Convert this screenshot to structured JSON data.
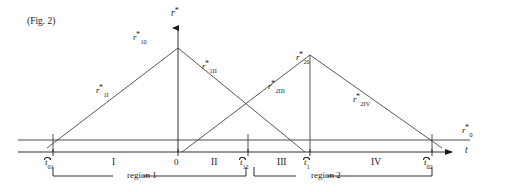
{
  "figure": {
    "caption": "(Fig. 2)",
    "axes": {
      "y_axis_label_base": "r",
      "y_axis_label_star": "*",
      "x_axis_label": "t",
      "baseline_label_base": "r",
      "baseline_label_sub": "0",
      "baseline_label_star": "*"
    },
    "curve_labels": [
      {
        "id": "r10",
        "base": "r",
        "sub": "10",
        "star": "*",
        "x": 133,
        "y": 33
      },
      {
        "id": "r1I",
        "base": "r",
        "sub": "1I",
        "star": "*",
        "x": 96,
        "y": 86
      },
      {
        "id": "r1II",
        "base": "r",
        "sub": "1II",
        "star": "*",
        "x": 202,
        "y": 62
      },
      {
        "id": "r2III",
        "base": "r",
        "sub": "2III",
        "star": "*",
        "x": 268,
        "y": 82
      },
      {
        "id": "r20",
        "base": "r",
        "sub": "20",
        "star": "*",
        "x": 296,
        "y": 53
      },
      {
        "id": "r2IV",
        "base": "r",
        "sub": "2IV",
        "star": "*",
        "x": 353,
        "y": 95
      }
    ],
    "ticks": [
      {
        "id": "t01",
        "base": "t",
        "sub": "01",
        "x": 53,
        "label_x": 45,
        "origin": false
      },
      {
        "id": "t0",
        "base": "0",
        "sub": "",
        "x": 178,
        "label_x": 174,
        "origin": true
      },
      {
        "id": "t12",
        "base": "t",
        "sub": "12",
        "x": 248,
        "label_x": 240,
        "origin": false
      },
      {
        "id": "t1",
        "base": "t",
        "sub": "1",
        "x": 310,
        "label_x": 304,
        "origin": false
      },
      {
        "id": "t02",
        "base": "t",
        "sub": "02",
        "x": 432,
        "label_x": 424,
        "origin": false
      }
    ],
    "interval_labels": [
      {
        "id": "I",
        "text": "I",
        "x": 112
      },
      {
        "id": "II",
        "text": "II",
        "x": 211
      },
      {
        "id": "III",
        "text": "III",
        "x": 277
      },
      {
        "id": "IV",
        "text": "IV",
        "x": 371
      }
    ],
    "region_brackets": [
      {
        "id": "region1",
        "label": "region 1",
        "x_start": 53,
        "x_end": 248,
        "label_x": 127
      },
      {
        "id": "region2",
        "label": "region 2",
        "x_start": 254,
        "x_end": 432,
        "label_x": 311
      }
    ],
    "colors": {
      "ink": "#1a1a1a",
      "line": "#3a3a3a",
      "background": "#ffffff"
    },
    "geometry": {
      "baseline_y": 140,
      "taxis_y": 152,
      "vaxis_x": 178,
      "peak1": {
        "x": 178,
        "y": 48
      },
      "peak2": {
        "x": 310,
        "y": 55
      }
    }
  }
}
